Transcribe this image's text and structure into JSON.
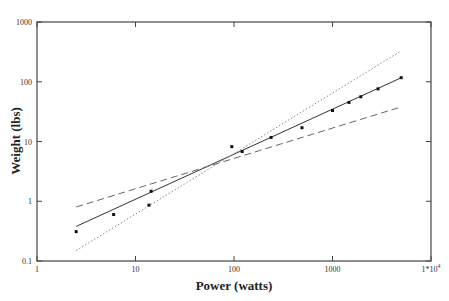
{
  "chart_data": {
    "type": "scatter",
    "title": "",
    "xlabel": "Power (watts)",
    "ylabel": "Weight (lbs)",
    "xscale": "log",
    "yscale": "log",
    "xlim": [
      1,
      10000
    ],
    "ylim": [
      0.1,
      1000
    ],
    "grid": false,
    "legend": null,
    "x_ticks": [
      {
        "value": 1,
        "label": "1"
      },
      {
        "value": 10,
        "label": "10"
      },
      {
        "value": 100,
        "label": "100"
      },
      {
        "value": 1000,
        "label": "1000"
      },
      {
        "value": 10000,
        "label": "1*10",
        "superscript": "4"
      }
    ],
    "y_ticks": [
      {
        "value": 0.1,
        "label": "0.1"
      },
      {
        "value": 1,
        "label": "1"
      },
      {
        "value": 10,
        "label": "10"
      },
      {
        "value": 100,
        "label": "100"
      },
      {
        "value": 1000,
        "label": "1000"
      }
    ],
    "points": [
      {
        "x": 2.5,
        "y": 0.31
      },
      {
        "x": 6.0,
        "y": 0.6
      },
      {
        "x": 13.7,
        "y": 0.86
      },
      {
        "x": 14.4,
        "y": 1.47
      },
      {
        "x": 95,
        "y": 8.2
      },
      {
        "x": 121,
        "y": 6.8
      },
      {
        "x": 238,
        "y": 11.7
      },
      {
        "x": 490,
        "y": 17
      },
      {
        "x": 1000,
        "y": 33
      },
      {
        "x": 1470,
        "y": 45
      },
      {
        "x": 1940,
        "y": 56
      },
      {
        "x": 2900,
        "y": 76
      },
      {
        "x": 4980,
        "y": 117
      }
    ],
    "series": [
      {
        "name": "fit",
        "style": "solid",
        "x": [
          2.5,
          5000
        ],
        "y": [
          0.38,
          117
        ]
      },
      {
        "name": "lower-bound",
        "style": "dashed",
        "x": [
          2.5,
          5000
        ],
        "y": [
          0.8,
          38
        ]
      },
      {
        "name": "upper-bound",
        "style": "dotted",
        "x": [
          2.5,
          5000
        ],
        "y": [
          0.15,
          330
        ]
      }
    ]
  }
}
